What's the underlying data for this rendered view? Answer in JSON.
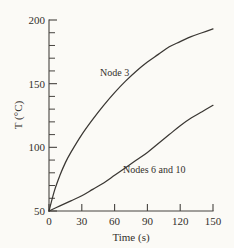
{
  "chart_data": {
    "type": "line",
    "title": "",
    "xlabel": "Time (s)",
    "ylabel": "T (°C)",
    "xlim": [
      0,
      150
    ],
    "ylim": [
      50,
      200
    ],
    "grid": false,
    "legend_position": "inline-annotations",
    "x_ticks": [
      0,
      30,
      60,
      90,
      120,
      150
    ],
    "x_tick_labels": [
      "0",
      "30",
      "60",
      "90",
      "120",
      "150"
    ],
    "y_ticks": [
      50,
      100,
      150,
      200
    ],
    "y_tick_labels": [
      "50",
      "100",
      "150",
      "200"
    ],
    "y_minor_tick_interval": 10,
    "series": [
      {
        "name": "Node 3",
        "label": "Node 3",
        "x": [
          0,
          5,
          10,
          15,
          20,
          30,
          40,
          50,
          60,
          70,
          80,
          90,
          100,
          110,
          120,
          130,
          140,
          150
        ],
        "values": [
          50,
          66,
          78,
          88,
          96,
          110,
          122,
          133,
          143,
          152,
          160,
          167,
          173,
          179,
          183,
          187,
          190,
          193
        ]
      },
      {
        "name": "Nodes 6 and 10",
        "label": "Nodes 6 and 10",
        "x": [
          0,
          10,
          20,
          30,
          40,
          50,
          60,
          70,
          80,
          90,
          100,
          110,
          120,
          130,
          140,
          150
        ],
        "values": [
          50,
          54,
          58,
          62,
          67,
          72,
          78,
          84,
          90,
          96,
          103,
          110,
          117,
          123,
          128,
          133
        ]
      }
    ],
    "annotations": [
      {
        "text": "Node 3",
        "x": 45,
        "y": 152
      },
      {
        "text": "Nodes 6 and 10",
        "x": 78,
        "y": 80
      }
    ],
    "colors": {
      "background": "#fbfaf6",
      "axis": "#46433f",
      "curve": "#3a3733",
      "text": "#33302c"
    }
  },
  "axis_labels": {
    "x_title": "Time (s)",
    "y_title": "T (°C)"
  },
  "y_tick_text": {
    "t200": "200",
    "t150": "150",
    "t100": "100",
    "t50": "50"
  },
  "x_tick_text": {
    "t0": "0",
    "t30": "30",
    "t60": "60",
    "t90": "90",
    "t120": "120",
    "t150": "150"
  },
  "curve_labels": {
    "node3": "Node 3",
    "nodes6and10": "Nodes 6 and 10"
  }
}
